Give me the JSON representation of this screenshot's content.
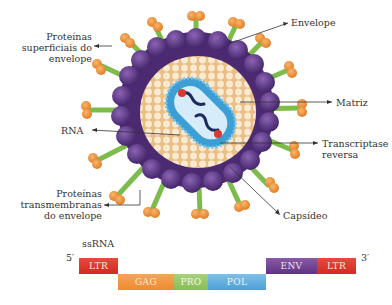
{
  "virus_labels": {
    "surface_proteins": [
      "Proteínas",
      "superficiais do",
      "envelope"
    ],
    "envelope": "Envelope",
    "matrix": "Matriz",
    "rna": "RNA",
    "reverse_transcriptase": [
      "Transcriptase",
      "reversa"
    ],
    "transmembrane_proteins": [
      "Proteínas",
      "transmembranas",
      "do envelope"
    ],
    "capsid": "Capsídeo"
  },
  "genome": {
    "title": "ssRNA",
    "five_prime": "5′",
    "three_prime": "3′",
    "segments": [
      {
        "label": "LTR",
        "color": "#dc3a2e"
      },
      {
        "label": "GAG",
        "color": "#f29a48"
      },
      {
        "label": "PRO",
        "color": "#95c665"
      },
      {
        "label": "POL",
        "color": "#5fabdd"
      },
      {
        "label": "ENV",
        "color": "#6e4192"
      },
      {
        "label": "LTR",
        "color": "#dc3a2e"
      }
    ]
  },
  "colors": {
    "envelope_purple": "#5b3480",
    "spike_stalk": "#7dbb4a",
    "spike_head": "#ec8a36",
    "matrix_tan": "#f3d8b0",
    "capsid_blue": "#3b9fd4",
    "rna_dark": "#1d2a5e",
    "rt_red": "#d83a30"
  }
}
